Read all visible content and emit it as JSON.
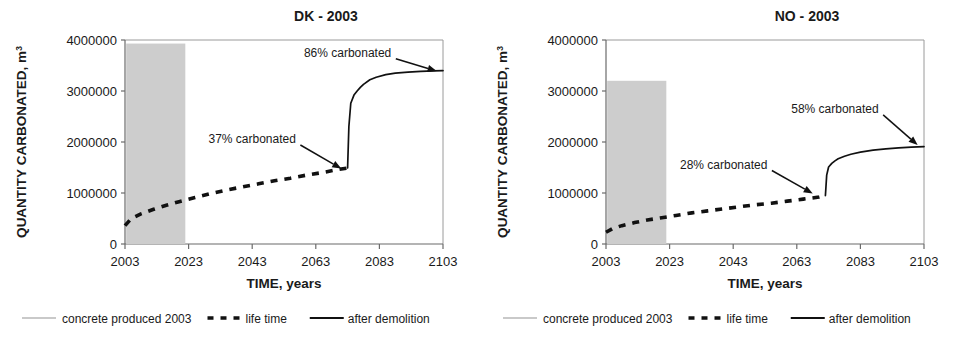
{
  "figure": {
    "width": 962,
    "height": 340,
    "background": "#ffffff"
  },
  "colors": {
    "line": "#111111",
    "produced_bar": "#cdcdcd",
    "axis": "#6b6b6b",
    "border": "#9a9a9a",
    "text": "#1a1a1a"
  },
  "common": {
    "ylabel_main": "QUANTITY CARBONATED, m",
    "ylabel_sup": "3",
    "xlabel": "TIME, years",
    "xticks": [
      "2003",
      "2023",
      "2043",
      "2063",
      "2083",
      "2103"
    ],
    "yticks": [
      "0",
      "1000000",
      "2000000",
      "3000000",
      "4000000"
    ],
    "legend": [
      {
        "label": "concrete produced 2003",
        "marker": "grey-line-swatch"
      },
      {
        "label": "life time",
        "marker": "dashed-line-swatch"
      },
      {
        "label": "after demolition",
        "marker": "solid-line-swatch"
      }
    ]
  },
  "chart_data": [
    {
      "type": "line",
      "id": "dk-2003",
      "title": "DK - 2003",
      "xlabel": "TIME, years",
      "ylabel": "QUANTITY CARBONATED, m3",
      "xlim": [
        2003,
        2103
      ],
      "ylim": [
        0,
        4000000
      ],
      "xticks": [
        2003,
        2023,
        2043,
        2063,
        2083,
        2103
      ],
      "yticks": [
        0,
        1000000,
        2000000,
        3000000,
        4000000
      ],
      "grid": false,
      "legend_position": "below",
      "annotations": [
        {
          "text": "37% carbonated",
          "x": 2043,
          "y": 1980000,
          "points_to_x": 2071,
          "points_to_y": 1480000
        },
        {
          "text": "86% carbonated",
          "x": 2073,
          "y": 3670000,
          "points_to_x": 2101,
          "points_to_y": 3390000
        }
      ],
      "series": [
        {
          "name": "concrete produced 2003",
          "type": "bar",
          "x": 2004,
          "value": 3930000,
          "bar_width_years": 3
        },
        {
          "name": "life time",
          "type": "dashed-line",
          "x": [
            2003,
            2005,
            2008,
            2012,
            2016,
            2020,
            2025,
            2030,
            2035,
            2040,
            2045,
            2050,
            2055,
            2060,
            2065,
            2070,
            2073
          ],
          "values": [
            360000,
            500000,
            590000,
            680000,
            760000,
            830000,
            910000,
            990000,
            1060000,
            1120000,
            1180000,
            1240000,
            1290000,
            1350000,
            1400000,
            1460000,
            1490000
          ]
        },
        {
          "name": "after demolition",
          "type": "solid-line",
          "x": [
            2073,
            2073.4,
            2074,
            2075,
            2076,
            2077,
            2078,
            2080,
            2082,
            2085,
            2088,
            2092,
            2096,
            2100,
            2103
          ],
          "values": [
            1490000,
            2300000,
            2760000,
            2920000,
            3000000,
            3070000,
            3130000,
            3220000,
            3270000,
            3320000,
            3350000,
            3370000,
            3385000,
            3395000,
            3400000
          ]
        }
      ]
    },
    {
      "type": "line",
      "id": "no-2003",
      "title": "NO - 2003",
      "xlabel": "TIME, years",
      "ylabel": "QUANTITY CARBONATED, m3",
      "xlim": [
        2003,
        2103
      ],
      "ylim": [
        0,
        4000000
      ],
      "xticks": [
        2003,
        2023,
        2043,
        2063,
        2083,
        2103
      ],
      "yticks": [
        0,
        1000000,
        2000000,
        3000000,
        4000000
      ],
      "grid": false,
      "legend_position": "below",
      "annotations": [
        {
          "text": "28% carbonated",
          "x": 2040,
          "y": 1480000,
          "points_to_x": 2068,
          "points_to_y": 990000
        },
        {
          "text": "58% carbonated",
          "x": 2075,
          "y": 2570000,
          "points_to_x": 2101,
          "points_to_y": 1940000
        }
      ],
      "series": [
        {
          "name": "concrete produced 2003",
          "type": "bar",
          "x": 2004,
          "value": 3200000,
          "bar_width_years": 3
        },
        {
          "name": "life time",
          "type": "dashed-line",
          "x": [
            2003,
            2005,
            2008,
            2012,
            2016,
            2020,
            2025,
            2030,
            2035,
            2040,
            2045,
            2050,
            2055,
            2060,
            2065,
            2070,
            2072
          ],
          "values": [
            230000,
            300000,
            360000,
            420000,
            470000,
            510000,
            560000,
            610000,
            650000,
            690000,
            730000,
            770000,
            800000,
            840000,
            880000,
            920000,
            950000
          ]
        },
        {
          "name": "after demolition",
          "type": "solid-line",
          "x": [
            2072,
            2072.4,
            2073,
            2074,
            2075,
            2076,
            2078,
            2080,
            2083,
            2087,
            2091,
            2095,
            2099,
            2103
          ],
          "values": [
            950000,
            1350000,
            1510000,
            1580000,
            1630000,
            1670000,
            1720000,
            1760000,
            1800000,
            1840000,
            1865000,
            1885000,
            1900000,
            1910000
          ]
        }
      ]
    }
  ]
}
